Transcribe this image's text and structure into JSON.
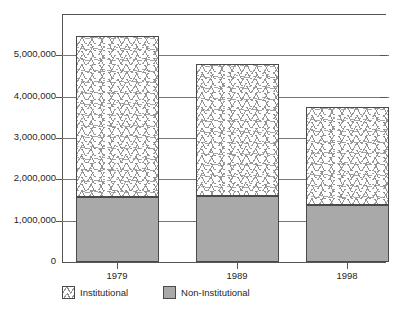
{
  "chart_data": {
    "type": "bar",
    "subtype": "stacked-column",
    "title": "",
    "xlabel": "",
    "ylabel": "",
    "categories": [
      "1979",
      "1989",
      "1998"
    ],
    "series": [
      {
        "name": "Non-Institutional",
        "values": [
          1580000,
          1600000,
          1380000
        ],
        "color": "#a9a9a9"
      },
      {
        "name": "Institutional",
        "values": [
          3880000,
          3200000,
          2380000
        ],
        "color": "#ffffff"
      }
    ],
    "totals": [
      5460000,
      4800000,
      3760000
    ],
    "ylim": [
      0,
      6000000
    ],
    "ytick_values": [
      0,
      1000000,
      2000000,
      3000000,
      4000000,
      5000000
    ],
    "ytick_labels": [
      "0",
      "1,000,000",
      "2,000,000",
      "3,000,000",
      "4,000,000",
      "5,000,000"
    ],
    "grid": true,
    "legend_position": "bottom-left",
    "legend_entries": [
      "Institutional",
      "Non-Institutional"
    ]
  },
  "legend": {
    "institutional_label": "Institutional",
    "noninstitutional_label": "Non-Institutional"
  }
}
